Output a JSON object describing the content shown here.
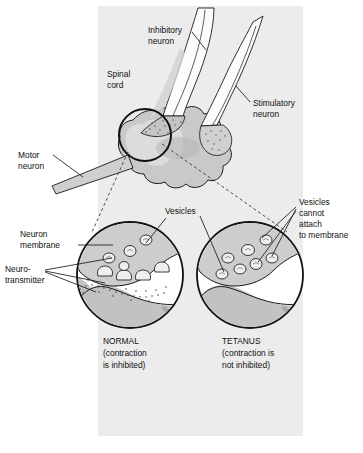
{
  "figure": {
    "panel_color": "#ececec",
    "background_color": "#ffffff",
    "ink_color": "#1a1a1a",
    "cell_fill": "#c9c9c9",
    "cell_fill_light": "#dedede",
    "vesicle_fill": "#f4f4f4"
  },
  "labels": {
    "inhibitory_neuron": "Inhibitory\nneuron",
    "inhibitory_neuron_l1": "Inhibitory",
    "inhibitory_neuron_l2": "neuron",
    "spinal_cord_l1": "Spinal",
    "spinal_cord_l2": "cord",
    "stimulatory_neuron_l1": "Stimulatory",
    "stimulatory_neuron_l2": "neuron",
    "motor_neuron_l1": "Motor",
    "motor_neuron_l2": "neuron",
    "vesicles": "Vesicles",
    "neuron_membrane_l1": "Neuron",
    "neuron_membrane_l2": "membrane",
    "neurotransmitter_l1": "Neuro-",
    "neurotransmitter_l2": "transmitter",
    "vesicles_cannot_l1": "Vesicles",
    "vesicles_cannot_l2": "cannot",
    "vesicles_cannot_l3": "attach",
    "vesicles_cannot_l4": "to membrane"
  },
  "captions": {
    "normal": {
      "heading": "NORMAL",
      "line1": "(contraction",
      "line2": "is inhibited)"
    },
    "tetanus": {
      "heading": "TETANUS",
      "line1": "(contraction is",
      "line2": "not inhibited)"
    }
  },
  "detail_circles": [
    {
      "name": "normal",
      "cx": 130,
      "cy": 275,
      "r": 53,
      "state": "vesicles fused to membrane, neurotransmitter released"
    },
    {
      "name": "tetanus",
      "cx": 250,
      "cy": 275,
      "r": 53,
      "state": "vesicles free in cytoplasm, no neurotransmitter released"
    }
  ],
  "magnifier": {
    "cx": 145,
    "cy": 135,
    "r": 26
  }
}
